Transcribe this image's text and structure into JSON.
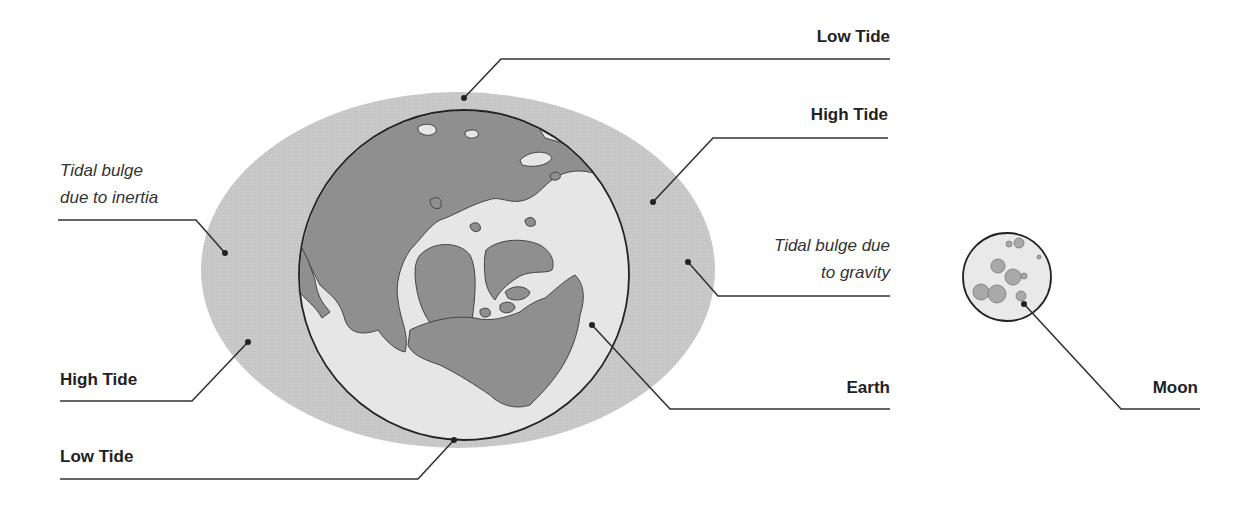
{
  "diagram": {
    "colors": {
      "bulge": "#c9c9c9",
      "ocean": "#e6e6e6",
      "land": "#8f8f8f",
      "outline": "#222222",
      "moon_fill": "#e9e9e9",
      "crater": "#a9a9a9"
    },
    "labels": {
      "low_tide_top": "Low Tide",
      "high_tide_right": "High Tide",
      "bulge_inertia_line1": "Tidal bulge",
      "bulge_inertia_line2": "due to inertia",
      "bulge_gravity_line1": "Tidal bulge due",
      "bulge_gravity_line2": "to gravity",
      "high_tide_left": "High Tide",
      "earth": "Earth",
      "low_tide_bottom": "Low Tide",
      "moon": "Moon"
    }
  }
}
